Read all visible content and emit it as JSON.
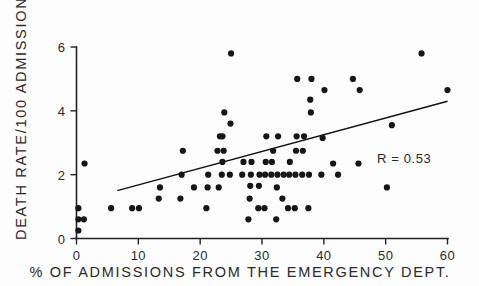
{
  "chart_data": {
    "type": "scatter",
    "title": "",
    "subtitle": "",
    "xlabel": "% OF ADMISSIONS FROM THE EMERGENCY DEPT.",
    "ylabel": "DEATH RATE/100 ADMISSIONS",
    "xlim": [
      0,
      60
    ],
    "ylim": [
      0,
      6
    ],
    "xticks": [
      0,
      10,
      20,
      30,
      40,
      50,
      60
    ],
    "xtick_labels": [
      "0",
      "10",
      "20",
      "30",
      "40",
      "50",
      "60"
    ],
    "yticks": [
      0,
      2,
      4,
      6
    ],
    "ytick_labels": [
      "0",
      "2",
      "4",
      "6"
    ],
    "grid": false,
    "legend": null,
    "legend_position": "none",
    "annotations": [
      {
        "name": "correlation-coefficient",
        "text": "R = 0.53",
        "x": 53.0,
        "y": 2.35
      }
    ],
    "marker": {
      "shape": "circle",
      "color": "#161616",
      "size_px": 3.1
    },
    "trendline": {
      "name": "regression-line",
      "type": "linear",
      "color": "#111111",
      "x_start": 6.6,
      "y_start": 1.5,
      "x_end": 60.0,
      "y_end": 4.3
    },
    "points": [
      [
        0.3,
        0.95
      ],
      [
        0.3,
        0.6
      ],
      [
        0.3,
        0.25
      ],
      [
        1.2,
        0.6
      ],
      [
        1.3,
        2.35
      ],
      [
        5.6,
        0.95
      ],
      [
        9.0,
        0.95
      ],
      [
        10.1,
        0.95
      ],
      [
        13.3,
        1.25
      ],
      [
        13.5,
        1.6
      ],
      [
        16.8,
        1.25
      ],
      [
        17.0,
        2.0
      ],
      [
        17.2,
        2.75
      ],
      [
        19.0,
        1.6
      ],
      [
        21.0,
        0.95
      ],
      [
        21.2,
        1.6
      ],
      [
        21.3,
        2.0
      ],
      [
        22.8,
        2.75
      ],
      [
        23.0,
        1.6
      ],
      [
        23.2,
        3.2
      ],
      [
        23.5,
        2.0
      ],
      [
        23.6,
        2.4
      ],
      [
        23.6,
        3.2
      ],
      [
        23.8,
        2.75
      ],
      [
        23.9,
        3.95
      ],
      [
        24.8,
        2.0
      ],
      [
        24.9,
        3.6
      ],
      [
        25.0,
        5.8
      ],
      [
        26.8,
        2.0
      ],
      [
        27.0,
        2.4
      ],
      [
        27.8,
        0.6
      ],
      [
        28.0,
        1.25
      ],
      [
        28.1,
        1.65
      ],
      [
        28.2,
        2.0
      ],
      [
        28.3,
        2.4
      ],
      [
        29.4,
        0.95
      ],
      [
        29.5,
        1.65
      ],
      [
        29.6,
        2.0
      ],
      [
        30.4,
        0.95
      ],
      [
        30.5,
        2.0
      ],
      [
        30.6,
        2.4
      ],
      [
        30.7,
        3.2
      ],
      [
        31.5,
        2.0
      ],
      [
        31.6,
        2.4
      ],
      [
        31.8,
        2.75
      ],
      [
        32.3,
        0.6
      ],
      [
        32.4,
        1.6
      ],
      [
        32.5,
        2.0
      ],
      [
        32.6,
        3.2
      ],
      [
        33.3,
        1.25
      ],
      [
        33.5,
        2.0
      ],
      [
        34.2,
        0.95
      ],
      [
        34.4,
        2.0
      ],
      [
        34.5,
        2.4
      ],
      [
        35.3,
        0.95
      ],
      [
        35.4,
        2.0
      ],
      [
        35.5,
        2.75
      ],
      [
        35.6,
        3.2
      ],
      [
        35.7,
        5.0
      ],
      [
        36.5,
        2.0
      ],
      [
        36.6,
        2.75
      ],
      [
        36.8,
        3.2
      ],
      [
        37.5,
        0.95
      ],
      [
        37.6,
        2.0
      ],
      [
        37.8,
        4.35
      ],
      [
        37.9,
        3.95
      ],
      [
        38.0,
        5.0
      ],
      [
        39.6,
        2.0
      ],
      [
        39.8,
        3.15
      ],
      [
        40.1,
        4.65
      ],
      [
        41.5,
        2.35
      ],
      [
        42.3,
        2.0
      ],
      [
        44.7,
        5.0
      ],
      [
        45.6,
        2.35
      ],
      [
        45.8,
        4.65
      ],
      [
        50.2,
        1.6
      ],
      [
        51.0,
        3.55
      ],
      [
        55.8,
        5.8
      ],
      [
        60.0,
        4.65
      ]
    ]
  },
  "axes": {
    "x_axis_name": "x-axis",
    "y_axis_name": "y-axis"
  }
}
